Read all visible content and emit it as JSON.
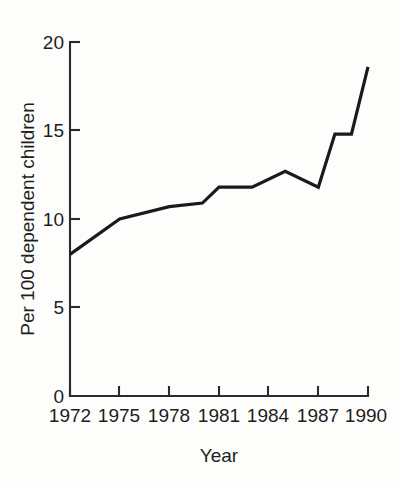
{
  "chart_data": {
    "type": "line",
    "title": "",
    "xlabel": "Year",
    "ylabel": "Per 100 dependent children",
    "xlim": [
      1972,
      1990
    ],
    "ylim": [
      0,
      20
    ],
    "grid": false,
    "legend": null,
    "x_tick_labels": [
      "1972",
      "1975",
      "1978",
      "1981",
      "1984",
      "1987",
      "1990"
    ],
    "x_tick_values": [
      1972,
      1975,
      1978,
      1981,
      1984,
      1987,
      1990
    ],
    "y_tick_labels": [
      "0",
      "5",
      "10",
      "15",
      "20"
    ],
    "y_tick_values": [
      0,
      5,
      10,
      15,
      20
    ],
    "line_color": "#1a1a1a",
    "series": [
      {
        "name": "Per 100 dependent children",
        "x": [
          1972,
          1975,
          1978,
          1980,
          1981,
          1983,
          1985,
          1987,
          1988,
          1989,
          1990
        ],
        "values": [
          8.0,
          10.0,
          10.7,
          10.9,
          11.8,
          11.8,
          12.7,
          11.8,
          14.8,
          14.8,
          18.6
        ]
      }
    ]
  },
  "axes": {
    "y_title": "Per 100 dependent children",
    "x_title": "Year"
  }
}
